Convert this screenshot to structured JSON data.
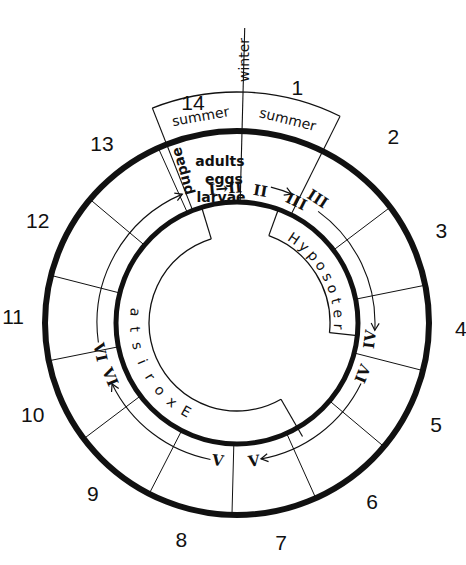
{
  "chart_data": {
    "type": "diagram",
    "title": "",
    "center": [
      237,
      323
    ],
    "radii": {
      "outer_thick": 192,
      "inner_thick": 121,
      "band_inner": 88,
      "season_box": 231,
      "winter_line_end": 295,
      "numbers": 216,
      "arrows": 138
    },
    "sector_count": 14,
    "sector_start_angle_deg": 1.5,
    "sectors": [
      "1",
      "2",
      "3",
      "4",
      "5",
      "6",
      "7",
      "8",
      "9",
      "10",
      "11",
      "12",
      "13",
      "14"
    ],
    "season_labels": [
      {
        "sector": "1",
        "label": "summer"
      },
      {
        "sector": "2",
        "label": "summer"
      }
    ],
    "winter_label": "winter",
    "stage_labels": [
      {
        "text": "adults",
        "x": 220,
        "y": 166
      },
      {
        "text": "eggs",
        "x": 224,
        "y": 184
      },
      {
        "text": "larvae",
        "x": 221,
        "y": 202
      }
    ],
    "pupae_label": "pupae",
    "parasitoids": [
      {
        "name": "Exorista",
        "from_deg": 210,
        "to_deg": 276,
        "direction": "reverse"
      },
      {
        "name": "Hyposoter",
        "from_deg": 34,
        "to_deg": 92,
        "direction": "forward"
      }
    ],
    "instars": [
      {
        "text": "I→II",
        "angle": -5,
        "r": 135
      },
      {
        "text": "II",
        "angle": 10,
        "r": 134
      },
      {
        "text": "III",
        "angle": 26,
        "r": 135
      },
      {
        "text": "III",
        "angle": 33,
        "r": 148
      },
      {
        "text": "IV",
        "angle": 97,
        "r": 134
      },
      {
        "text": "IV",
        "angle": 112,
        "r": 136
      },
      {
        "text": "V",
        "angle": 173,
        "r": 139
      },
      {
        "text": "V",
        "angle": 188,
        "r": 139
      },
      {
        "text": "VI",
        "angle": 247,
        "r": 138
      },
      {
        "text": "VI",
        "angle": 258,
        "r": 140
      }
    ],
    "arrows": [
      {
        "from_deg": 14,
        "to_deg": 23,
        "r": 140,
        "label": "II to III"
      },
      {
        "from_deg": 36,
        "to_deg": 93,
        "r": 138,
        "label": "Hyposoter III to IV"
      },
      {
        "from_deg": 116,
        "to_deg": 170,
        "r": 138,
        "label": "IV to V"
      },
      {
        "from_deg": 191,
        "to_deg": 244,
        "r": 139,
        "label": "V to VI"
      },
      {
        "from_deg": 262,
        "to_deg": 337,
        "r": 140,
        "label": "VI to pupae"
      }
    ],
    "colors": {
      "ink": "#111111",
      "background": "#ffffff"
    }
  }
}
